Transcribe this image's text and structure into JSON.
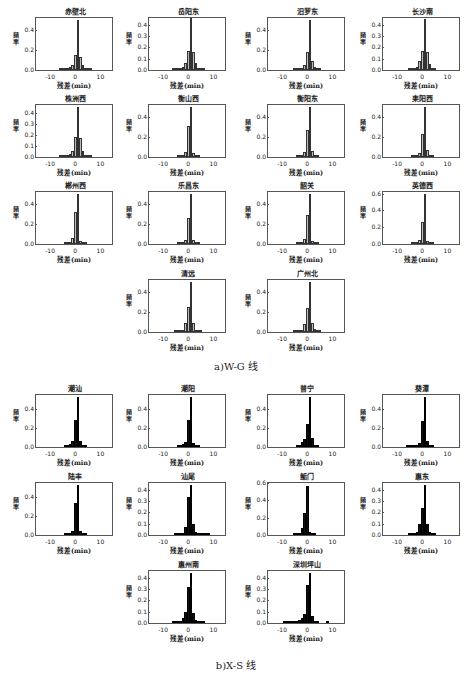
{
  "captions": {
    "wg": "a)W-G 线",
    "xs": "b)X-S 线"
  },
  "axis": {
    "xlabel": "残差(min)",
    "ylabel": "频率",
    "xticks": [
      "-10",
      "0",
      "10"
    ]
  },
  "chart_data": [
    {
      "type": "bar",
      "group": "W-G",
      "title": "赤壁北",
      "xlabel": "残差(min)",
      "ylabel": "频率",
      "xlim": [
        -16,
        15
      ],
      "ylim": [
        0,
        0.52
      ],
      "yticks": [
        0.0,
        0.2,
        0.4
      ],
      "x": [
        -6,
        -5,
        -4,
        -3,
        -2,
        -1,
        0,
        1,
        2,
        3,
        4,
        5,
        6
      ],
      "values": [
        0.005,
        0.008,
        0.01,
        0.015,
        0.03,
        0.05,
        0.15,
        0.5,
        0.13,
        0.05,
        0.02,
        0.01,
        0.005
      ]
    },
    {
      "type": "bar",
      "group": "W-G",
      "title": "岳阳东",
      "xlabel": "残差(min)",
      "ylabel": "频率",
      "xlim": [
        -16,
        15
      ],
      "ylim": [
        0,
        0.46
      ],
      "yticks": [
        0.0,
        0.1,
        0.2,
        0.3,
        0.4
      ],
      "x": [
        -6,
        -5,
        -4,
        -3,
        -2,
        -1,
        0,
        1,
        2,
        3,
        4,
        5,
        6
      ],
      "values": [
        0.004,
        0.006,
        0.008,
        0.012,
        0.03,
        0.06,
        0.17,
        0.46,
        0.16,
        0.06,
        0.02,
        0.01,
        0.005
      ]
    },
    {
      "type": "bar",
      "group": "W-G",
      "title": "汨罗东",
      "xlabel": "残差(min)",
      "ylabel": "频率",
      "xlim": [
        -16,
        15
      ],
      "ylim": [
        0,
        0.52
      ],
      "yticks": [
        0.0,
        0.2,
        0.4
      ],
      "x": [
        -5,
        -4,
        -3,
        -2,
        -1,
        0,
        1,
        2,
        3,
        4,
        5
      ],
      "values": [
        0.004,
        0.006,
        0.01,
        0.02,
        0.05,
        0.18,
        0.5,
        0.09,
        0.03,
        0.01,
        0.005
      ]
    },
    {
      "type": "bar",
      "group": "W-G",
      "title": "长沙南",
      "xlabel": "残差(min)",
      "ylabel": "频率",
      "xlim": [
        -16,
        15
      ],
      "ylim": [
        0,
        0.46
      ],
      "yticks": [
        0.0,
        0.1,
        0.2,
        0.3,
        0.4
      ],
      "x": [
        -5,
        -4,
        -3,
        -2,
        -1,
        0,
        1,
        2,
        3,
        4,
        5
      ],
      "values": [
        0.004,
        0.008,
        0.015,
        0.03,
        0.08,
        0.17,
        0.45,
        0.16,
        0.05,
        0.02,
        0.008
      ]
    },
    {
      "type": "bar",
      "group": "W-G",
      "title": "株洲西",
      "xlabel": "残差(min)",
      "ylabel": "频率",
      "xlim": [
        -16,
        15
      ],
      "ylim": [
        0,
        0.47
      ],
      "yticks": [
        0.0,
        0.1,
        0.2,
        0.3,
        0.4
      ],
      "x": [
        -6,
        -5,
        -4,
        -3,
        -2,
        -1,
        0,
        1,
        2,
        3,
        4,
        5,
        6
      ],
      "values": [
        0.004,
        0.006,
        0.01,
        0.015,
        0.03,
        0.05,
        0.18,
        0.45,
        0.17,
        0.05,
        0.02,
        0.01,
        0.005
      ]
    },
    {
      "type": "bar",
      "group": "W-G",
      "title": "衡山西",
      "xlabel": "残差(min)",
      "ylabel": "频率",
      "xlim": [
        -16,
        15
      ],
      "ylim": [
        0,
        0.52
      ],
      "yticks": [
        0.0,
        0.2,
        0.4
      ],
      "x": [
        -4,
        -3,
        -2,
        -1,
        0,
        1,
        2,
        3,
        4
      ],
      "values": [
        0.005,
        0.01,
        0.02,
        0.05,
        0.31,
        0.5,
        0.04,
        0.01,
        0.005
      ]
    },
    {
      "type": "bar",
      "group": "W-G",
      "title": "衡阳东",
      "xlabel": "残差(min)",
      "ylabel": "频率",
      "xlim": [
        -16,
        15
      ],
      "ylim": [
        0,
        0.52
      ],
      "yticks": [
        0.0,
        0.2,
        0.4
      ],
      "x": [
        -4,
        -3,
        -2,
        -1,
        0,
        1,
        2,
        3,
        4
      ],
      "values": [
        0.004,
        0.008,
        0.02,
        0.05,
        0.27,
        0.5,
        0.06,
        0.01,
        0.005
      ]
    },
    {
      "type": "bar",
      "group": "W-G",
      "title": "耒阳西",
      "xlabel": "残差(min)",
      "ylabel": "频率",
      "xlim": [
        -16,
        15
      ],
      "ylim": [
        0,
        0.52
      ],
      "yticks": [
        0.0,
        0.2,
        0.4
      ],
      "x": [
        -4,
        -3,
        -2,
        -1,
        0,
        1,
        2,
        3,
        4
      ],
      "values": [
        0.005,
        0.01,
        0.02,
        0.04,
        0.23,
        0.5,
        0.07,
        0.01,
        0.005
      ]
    },
    {
      "type": "bar",
      "group": "W-G",
      "title": "郴州西",
      "xlabel": "残差(min)",
      "ylabel": "频率",
      "xlim": [
        -16,
        15
      ],
      "ylim": [
        0,
        0.52
      ],
      "yticks": [
        0.0,
        0.2,
        0.4
      ],
      "x": [
        -4,
        -3,
        -2,
        -1,
        0,
        1,
        2,
        3,
        4
      ],
      "values": [
        0.005,
        0.01,
        0.02,
        0.06,
        0.32,
        0.5,
        0.03,
        0.01,
        0.005
      ]
    },
    {
      "type": "bar",
      "group": "W-G",
      "title": "乐昌东",
      "xlabel": "残差(min)",
      "ylabel": "频率",
      "xlim": [
        -16,
        15
      ],
      "ylim": [
        0,
        0.52
      ],
      "yticks": [
        0.0,
        0.2,
        0.4
      ],
      "x": [
        -4,
        -3,
        -2,
        -1,
        0,
        1,
        2,
        3,
        4
      ],
      "values": [
        0.005,
        0.01,
        0.02,
        0.04,
        0.26,
        0.5,
        0.04,
        0.01,
        0.005
      ]
    },
    {
      "type": "bar",
      "group": "W-G",
      "title": "韶关",
      "xlabel": "残差(min)",
      "ylabel": "频率",
      "xlim": [
        -16,
        15
      ],
      "ylim": [
        0,
        0.52
      ],
      "yticks": [
        0.0,
        0.2,
        0.4
      ],
      "x": [
        -4,
        -3,
        -2,
        -1,
        0,
        1,
        2,
        3,
        4
      ],
      "values": [
        0.005,
        0.01,
        0.02,
        0.05,
        0.29,
        0.5,
        0.03,
        0.01,
        0.005
      ]
    },
    {
      "type": "bar",
      "group": "W-G",
      "title": "英德西",
      "xlabel": "残差(min)",
      "ylabel": "频率",
      "xlim": [
        -16,
        15
      ],
      "ylim": [
        0,
        0.62
      ],
      "yticks": [
        0.0,
        0.2,
        0.4,
        0.6
      ],
      "x": [
        -4,
        -3,
        -2,
        -1,
        0,
        1,
        2,
        3,
        4
      ],
      "values": [
        0.005,
        0.01,
        0.02,
        0.05,
        0.26,
        0.6,
        0.04,
        0.01,
        0.005
      ]
    },
    {
      "type": "bar",
      "group": "W-G",
      "title": "清远",
      "xlabel": "残差(min)",
      "ylabel": "频率",
      "xlim": [
        -16,
        15
      ],
      "ylim": [
        0,
        0.52
      ],
      "yticks": [
        0.0,
        0.2,
        0.4
      ],
      "x": [
        -5,
        -4,
        -3,
        -2,
        -1,
        0,
        1,
        2,
        3,
        4,
        5
      ],
      "values": [
        0.004,
        0.006,
        0.01,
        0.02,
        0.09,
        0.25,
        0.5,
        0.09,
        0.02,
        0.01,
        0.004
      ]
    },
    {
      "type": "bar",
      "group": "W-G",
      "title": "广州北",
      "xlabel": "残差(min)",
      "ylabel": "频率",
      "xlim": [
        -16,
        15
      ],
      "ylim": [
        0,
        0.52
      ],
      "yticks": [
        0.0,
        0.2,
        0.4
      ],
      "x": [
        -5,
        -4,
        -3,
        -2,
        -1,
        0,
        1,
        2,
        3,
        4,
        5
      ],
      "values": [
        0.004,
        0.006,
        0.01,
        0.02,
        0.08,
        0.24,
        0.5,
        0.09,
        0.03,
        0.01,
        0.004
      ]
    },
    {
      "type": "bar",
      "group": "X-S",
      "title": "潮汕",
      "xlabel": "残差(min)",
      "ylabel": "频率",
      "xlim": [
        -16,
        15
      ],
      "ylim": [
        0,
        0.55
      ],
      "yticks": [
        0.0,
        0.2,
        0.4
      ],
      "x": [
        -4,
        -3,
        -2,
        -1,
        0,
        1,
        2,
        3,
        4
      ],
      "values": [
        0.005,
        0.01,
        0.03,
        0.06,
        0.29,
        0.53,
        0.06,
        0.02,
        0.005
      ]
    },
    {
      "type": "bar",
      "group": "X-S",
      "title": "潮阳",
      "xlabel": "残差(min)",
      "ylabel": "频率",
      "xlim": [
        -16,
        15
      ],
      "ylim": [
        0,
        0.55
      ],
      "yticks": [
        0.0,
        0.2,
        0.4
      ],
      "x": [
        -4,
        -3,
        -2,
        -1,
        0,
        1,
        2,
        3,
        4
      ],
      "values": [
        0.005,
        0.01,
        0.03,
        0.05,
        0.29,
        0.53,
        0.04,
        0.01,
        0.005
      ]
    },
    {
      "type": "bar",
      "group": "X-S",
      "title": "普宁",
      "xlabel": "残差(min)",
      "ylabel": "频率",
      "xlim": [
        -16,
        15
      ],
      "ylim": [
        0,
        0.55
      ],
      "yticks": [
        0.0,
        0.2,
        0.4
      ],
      "x": [
        -4,
        -3,
        -2,
        -1,
        0,
        1,
        2,
        3,
        4
      ],
      "values": [
        0.005,
        0.02,
        0.05,
        0.09,
        0.24,
        0.53,
        0.1,
        0.02,
        0.005
      ]
    },
    {
      "type": "bar",
      "group": "X-S",
      "title": "葵潭",
      "xlabel": "残差(min)",
      "ylabel": "频率",
      "xlim": [
        -16,
        15
      ],
      "ylim": [
        0,
        0.55
      ],
      "yticks": [
        0.0,
        0.2,
        0.4
      ],
      "x": [
        -6,
        -5,
        -4,
        -3,
        -2,
        -1,
        0,
        1,
        2,
        3,
        4
      ],
      "values": [
        0.003,
        0.004,
        0.006,
        0.01,
        0.02,
        0.04,
        0.28,
        0.53,
        0.06,
        0.01,
        0.005
      ]
    },
    {
      "type": "bar",
      "group": "X-S",
      "title": "陆丰",
      "xlabel": "残差(min)",
      "ylabel": "频率",
      "xlim": [
        -16,
        15
      ],
      "ylim": [
        0,
        0.55
      ],
      "yticks": [
        0.0,
        0.2,
        0.4
      ],
      "x": [
        -4,
        -3,
        -2,
        -1,
        0,
        1,
        2,
        3,
        4
      ],
      "values": [
        0.005,
        0.01,
        0.02,
        0.04,
        0.34,
        0.53,
        0.04,
        0.01,
        0.005
      ]
    },
    {
      "type": "bar",
      "group": "X-S",
      "title": "汕尾",
      "xlabel": "残差(min)",
      "ylabel": "频率",
      "xlim": [
        -16,
        15
      ],
      "ylim": [
        0,
        0.46
      ],
      "yticks": [
        0.0,
        0.1,
        0.2,
        0.3,
        0.4
      ],
      "x": [
        -5,
        -4,
        -3,
        -2,
        -1,
        0,
        1,
        2,
        3,
        4,
        5,
        6,
        7,
        8
      ],
      "values": [
        0.003,
        0.006,
        0.01,
        0.02,
        0.07,
        0.34,
        0.44,
        0.1,
        0.03,
        0.01,
        0.006,
        0.004,
        0.003,
        0.002
      ]
    },
    {
      "type": "bar",
      "group": "X-S",
      "title": "鲘门",
      "xlabel": "残差(min)",
      "ylabel": "频率",
      "xlim": [
        -16,
        15
      ],
      "ylim": [
        0,
        0.6
      ],
      "yticks": [
        0.0,
        0.2,
        0.4,
        0.6
      ],
      "x": [
        -5,
        -4,
        -3,
        -2,
        -1,
        0,
        1,
        2,
        3
      ],
      "values": [
        0.005,
        0.01,
        0.02,
        0.08,
        0.25,
        0.57,
        0.04,
        0.01,
        0.005
      ]
    },
    {
      "type": "bar",
      "group": "X-S",
      "title": "惠东",
      "xlabel": "残差(min)",
      "ylabel": "频率",
      "xlim": [
        -16,
        15
      ],
      "ylim": [
        0,
        0.46
      ],
      "yticks": [
        0.0,
        0.1,
        0.2,
        0.3,
        0.4
      ],
      "x": [
        -5,
        -4,
        -3,
        -2,
        -1,
        0,
        1,
        2,
        3,
        4,
        5
      ],
      "values": [
        0.003,
        0.006,
        0.01,
        0.03,
        0.1,
        0.24,
        0.44,
        0.1,
        0.03,
        0.01,
        0.004
      ]
    },
    {
      "type": "bar",
      "group": "X-S",
      "title": "惠州南",
      "xlabel": "残差(min)",
      "ylabel": "频率",
      "xlim": [
        -16,
        15
      ],
      "ylim": [
        0,
        0.46
      ],
      "yticks": [
        0.0,
        0.1,
        0.2,
        0.3,
        0.4
      ],
      "x": [
        -6,
        -5,
        -4,
        -3,
        -2,
        -1,
        0,
        1,
        2,
        3,
        4,
        5,
        6
      ],
      "values": [
        0.003,
        0.006,
        0.01,
        0.02,
        0.04,
        0.1,
        0.32,
        0.44,
        0.09,
        0.03,
        0.02,
        0.01,
        0.005
      ]
    },
    {
      "type": "bar",
      "group": "X-S",
      "title": "深圳坪山",
      "xlabel": "残差(min)",
      "ylabel": "频率",
      "xlim": [
        -16,
        15
      ],
      "ylim": [
        0,
        0.46
      ],
      "yticks": [
        0.0,
        0.1,
        0.2,
        0.3,
        0.4
      ],
      "x": [
        -9,
        -8,
        -7,
        -6,
        -5,
        -4,
        -3,
        -2,
        -1,
        0,
        1,
        2,
        3,
        4,
        8
      ],
      "values": [
        0.003,
        0.004,
        0.006,
        0.01,
        0.015,
        0.02,
        0.03,
        0.04,
        0.08,
        0.34,
        0.44,
        0.06,
        0.02,
        0.01,
        0.005
      ]
    }
  ],
  "layout": [
    {
      "left": 11,
      "top": 7
    },
    {
      "left": 124,
      "top": 7
    },
    {
      "left": 243,
      "top": 7
    },
    {
      "left": 358,
      "top": 7
    },
    {
      "left": 11,
      "top": 94
    },
    {
      "left": 124,
      "top": 94
    },
    {
      "left": 243,
      "top": 94
    },
    {
      "left": 358,
      "top": 94
    },
    {
      "left": 11,
      "top": 181
    },
    {
      "left": 124,
      "top": 181
    },
    {
      "left": 243,
      "top": 181
    },
    {
      "left": 358,
      "top": 181
    },
    {
      "left": 124,
      "top": 269
    },
    {
      "left": 243,
      "top": 269
    },
    {
      "left": 11,
      "top": 384
    },
    {
      "left": 124,
      "top": 384
    },
    {
      "left": 243,
      "top": 384
    },
    {
      "left": 358,
      "top": 384
    },
    {
      "left": 11,
      "top": 472
    },
    {
      "left": 124,
      "top": 472
    },
    {
      "left": 243,
      "top": 472
    },
    {
      "left": 358,
      "top": 472
    },
    {
      "left": 124,
      "top": 560
    },
    {
      "left": 243,
      "top": 560
    }
  ]
}
